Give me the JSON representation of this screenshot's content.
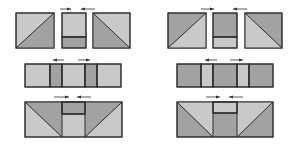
{
  "figure": {
    "colors": {
      "light": "#c9c9c9",
      "dark": "#a2a2a2",
      "stroke": "#2e2e2e",
      "arrow": "#2e2e2e",
      "background": "#ffffff"
    },
    "panels": [
      {
        "name": "left-set",
        "rows": [
          {
            "name": "row-1",
            "shapes": [
              {
                "type": "rect",
                "x": 16,
                "y": 13,
                "w": 38,
                "h": 35,
                "fill": "light"
              },
              {
                "type": "poly",
                "points": "16,48 54,13 54,48",
                "fill": "dark"
              },
              {
                "type": "line",
                "x1": 16,
                "y1": 48,
                "x2": 54,
                "y2": 13
              },
              {
                "type": "rect",
                "x": 62,
                "y": 13,
                "w": 24,
                "h": 24,
                "fill": "light"
              },
              {
                "type": "rect",
                "x": 62,
                "y": 37,
                "w": 24,
                "h": 11,
                "fill": "dark"
              },
              {
                "type": "rect",
                "x": 93,
                "y": 13,
                "w": 37,
                "h": 35,
                "fill": "light"
              },
              {
                "type": "poly",
                "points": "93,13 130,48 93,48",
                "fill": "dark"
              },
              {
                "type": "line",
                "x1": 93,
                "y1": 13,
                "x2": 130,
                "y2": 48
              }
            ],
            "arrows": [
              {
                "x1": 60,
                "x2": 71,
                "y": 9,
                "dir": "right"
              },
              {
                "x1": 81,
                "x2": 95,
                "y": 9,
                "dir": "left"
              }
            ]
          },
          {
            "name": "row-2",
            "shapes": [
              {
                "type": "rect",
                "x": 25,
                "y": 64,
                "w": 25,
                "h": 23,
                "fill": "light"
              },
              {
                "type": "rect",
                "x": 50,
                "y": 64,
                "w": 12,
                "h": 23,
                "fill": "dark"
              },
              {
                "type": "rect",
                "x": 62,
                "y": 64,
                "w": 23,
                "h": 23,
                "fill": "light"
              },
              {
                "type": "rect",
                "x": 85,
                "y": 64,
                "w": 12,
                "h": 23,
                "fill": "dark"
              },
              {
                "type": "rect",
                "x": 97,
                "y": 64,
                "w": 24,
                "h": 23,
                "fill": "light"
              }
            ],
            "arrows": [
              {
                "x1": 53,
                "x2": 64,
                "y": 60,
                "dir": "left"
              },
              {
                "x1": 78,
                "x2": 90,
                "y": 60,
                "dir": "right"
              }
            ]
          },
          {
            "name": "row-3",
            "shapes": [
              {
                "type": "rect",
                "x": 25,
                "y": 102,
                "w": 97,
                "h": 35,
                "fill": "light"
              },
              {
                "type": "poly",
                "points": "25,102 62,102 62,137",
                "fill": "dark"
              },
              {
                "type": "poly",
                "points": "85,102 122,102 85,137",
                "fill": "dark"
              },
              {
                "type": "rect",
                "x": 62,
                "y": 102,
                "w": 23,
                "h": 12,
                "fill": "dark"
              },
              {
                "type": "line",
                "x1": 25,
                "y1": 102,
                "x2": 62,
                "y2": 137
              },
              {
                "type": "line",
                "x1": 122,
                "y1": 102,
                "x2": 85,
                "y2": 137
              },
              {
                "type": "line",
                "x1": 62,
                "y1": 102,
                "x2": 62,
                "y2": 137
              },
              {
                "type": "line",
                "x1": 85,
                "y1": 102,
                "x2": 85,
                "y2": 137
              },
              {
                "type": "line",
                "x1": 62,
                "y1": 114,
                "x2": 85,
                "y2": 114
              }
            ],
            "arrows": [
              {
                "x1": 54,
                "x2": 69,
                "y": 97,
                "dir": "right"
              },
              {
                "x1": 77,
                "x2": 91,
                "y": 97,
                "dir": "left"
              }
            ]
          }
        ]
      },
      {
        "name": "right-set",
        "rows": [
          {
            "name": "row-1",
            "shapes": [
              {
                "type": "rect",
                "x": 168,
                "y": 13,
                "w": 38,
                "h": 35,
                "fill": "dark"
              },
              {
                "type": "poly",
                "points": "168,48 206,13 206,48",
                "fill": "light"
              },
              {
                "type": "line",
                "x1": 168,
                "y1": 48,
                "x2": 206,
                "y2": 13
              },
              {
                "type": "rect",
                "x": 213,
                "y": 13,
                "w": 24,
                "h": 24,
                "fill": "dark"
              },
              {
                "type": "rect",
                "x": 213,
                "y": 37,
                "w": 24,
                "h": 11,
                "fill": "light"
              },
              {
                "type": "rect",
                "x": 245,
                "y": 13,
                "w": 37,
                "h": 35,
                "fill": "dark"
              },
              {
                "type": "poly",
                "points": "245,13 282,48 245,48",
                "fill": "light"
              },
              {
                "type": "line",
                "x1": 245,
                "y1": 13,
                "x2": 282,
                "y2": 48
              }
            ],
            "arrows": [
              {
                "x1": 201,
                "x2": 214,
                "y": 9,
                "dir": "right"
              },
              {
                "x1": 233,
                "x2": 247,
                "y": 9,
                "dir": "left"
              }
            ]
          },
          {
            "name": "row-2",
            "shapes": [
              {
                "type": "rect",
                "x": 177,
                "y": 64,
                "w": 24,
                "h": 23,
                "fill": "dark"
              },
              {
                "type": "rect",
                "x": 201,
                "y": 64,
                "w": 12,
                "h": 23,
                "fill": "light"
              },
              {
                "type": "rect",
                "x": 213,
                "y": 64,
                "w": 24,
                "h": 23,
                "fill": "dark"
              },
              {
                "type": "rect",
                "x": 237,
                "y": 64,
                "w": 12,
                "h": 23,
                "fill": "light"
              },
              {
                "type": "rect",
                "x": 249,
                "y": 64,
                "w": 24,
                "h": 23,
                "fill": "dark"
              }
            ],
            "arrows": [
              {
                "x1": 205,
                "x2": 217,
                "y": 60,
                "dir": "left"
              },
              {
                "x1": 230,
                "x2": 243,
                "y": 60,
                "dir": "right"
              }
            ]
          },
          {
            "name": "row-3",
            "shapes": [
              {
                "type": "rect",
                "x": 177,
                "y": 102,
                "w": 96,
                "h": 35,
                "fill": "dark"
              },
              {
                "type": "poly",
                "points": "177,102 213,102 213,137",
                "fill": "light"
              },
              {
                "type": "poly",
                "points": "237,102 273,102 237,137",
                "fill": "light"
              },
              {
                "type": "rect",
                "x": 213,
                "y": 102,
                "w": 24,
                "h": 11,
                "fill": "light"
              },
              {
                "type": "line",
                "x1": 177,
                "y1": 102,
                "x2": 213,
                "y2": 137
              },
              {
                "type": "line",
                "x1": 273,
                "y1": 102,
                "x2": 237,
                "y2": 137
              },
              {
                "type": "line",
                "x1": 213,
                "y1": 102,
                "x2": 213,
                "y2": 137
              },
              {
                "type": "line",
                "x1": 237,
                "y1": 102,
                "x2": 237,
                "y2": 137
              },
              {
                "type": "line",
                "x1": 213,
                "y1": 113,
                "x2": 237,
                "y2": 113
              }
            ],
            "arrows": [
              {
                "x1": 206,
                "x2": 220,
                "y": 97,
                "dir": "right"
              },
              {
                "x1": 229,
                "x2": 243,
                "y": 97,
                "dir": "left"
              }
            ]
          }
        ]
      }
    ]
  }
}
